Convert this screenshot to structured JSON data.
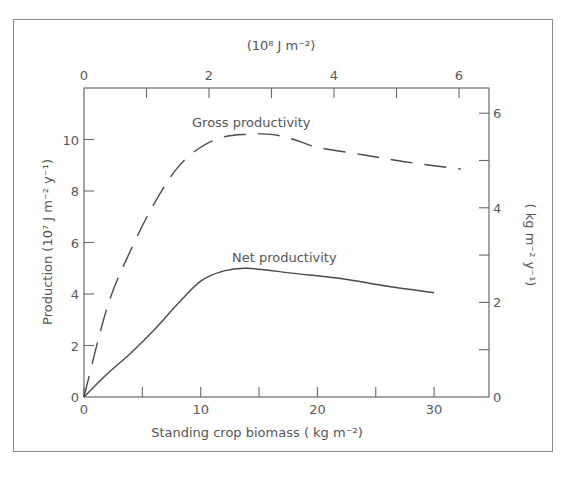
{
  "chart_data": {
    "type": "line",
    "title": "",
    "xlabel": "Standing crop biomass (kg m⁻²)",
    "ylabel": "Production (10⁷ J m⁻² y⁻¹)",
    "x2label": "(10⁸ J m⁻²)",
    "y2label": "(kg m⁻² y⁻¹)",
    "xlim": [
      0,
      34.7
    ],
    "ylim": [
      0,
      12
    ],
    "x2lim": [
      0,
      6.5
    ],
    "y2lim": [
      0,
      6.5
    ],
    "xticks": [
      0,
      10,
      20,
      30
    ],
    "xminorticks": [
      5,
      15,
      25
    ],
    "yticks": [
      0,
      2,
      4,
      6,
      8,
      10
    ],
    "x2ticks": [
      0,
      2,
      4,
      6
    ],
    "x2minorticks": [
      1,
      3,
      5
    ],
    "y2ticks": [
      0,
      2,
      4,
      6
    ],
    "y2minorticks": [
      1,
      3,
      5
    ],
    "grid": false,
    "legend": "inline annotations",
    "series": [
      {
        "name": "Gross productivity",
        "style": "dashed",
        "x": [
          0,
          2,
          4,
          6,
          8,
          10,
          12,
          14,
          16,
          18,
          20,
          24,
          28,
          32.3
        ],
        "values": [
          0,
          3.5,
          5.7,
          7.5,
          8.9,
          9.7,
          10.1,
          10.2,
          10.2,
          10.0,
          9.7,
          9.4,
          9.1,
          8.85
        ]
      },
      {
        "name": "Net productivity",
        "style": "solid",
        "x": [
          0,
          2,
          4,
          6,
          8,
          10,
          12,
          14,
          18,
          22,
          26,
          30
        ],
        "values": [
          0,
          0.9,
          1.7,
          2.6,
          3.6,
          4.5,
          4.9,
          5.0,
          4.8,
          4.6,
          4.3,
          4.05
        ]
      }
    ]
  },
  "labels": {
    "top_axis": "(10⁸ J m⁻²)",
    "bottom_axis": "Standing crop biomass ( kg m⁻²)",
    "left_axis": "Production  (10⁷ J m⁻² y⁻¹)",
    "right_axis": "( kg m⁻² y⁻¹)",
    "gross_annotation": "Gross productivity",
    "net_annotation": "Net productivity"
  },
  "ticks": {
    "bottom": [
      "0",
      "10",
      "20",
      "30"
    ],
    "left": [
      "0",
      "2",
      "4",
      "6",
      "8",
      "10"
    ],
    "top": [
      "0",
      "2",
      "4",
      "6"
    ],
    "right": [
      "0",
      "2",
      "4",
      "6"
    ]
  }
}
